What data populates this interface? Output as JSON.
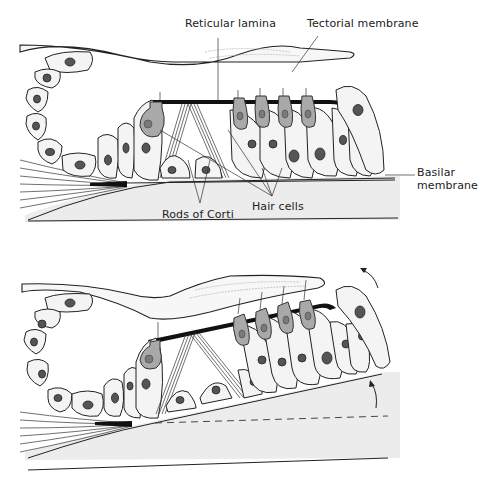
{
  "figure": {
    "panels": [
      {
        "id": "resting",
        "labels": {
          "reticular_lamina": "Reticular lamina",
          "tectorial_membrane": "Tectorial membrane",
          "basilar_membrane_line1": "Basilar",
          "basilar_membrane_line2": "membrane",
          "rods_of_corti": "Rods of Corti",
          "hair_cells": "Hair cells"
        }
      },
      {
        "id": "displaced",
        "labels": {},
        "annotations": [
          "upward-arrow-basilar",
          "rotation-arrow-tectorial",
          "dashed-rest-position-line"
        ]
      }
    ]
  },
  "colors": {
    "background": "#ffffff",
    "outline": "#222222",
    "hair_cell_fill": "#a9a9a9",
    "cell_fill": "#f4f4f4",
    "reticular_lamina": "#111111",
    "basilar_shade": "#ececec"
  }
}
